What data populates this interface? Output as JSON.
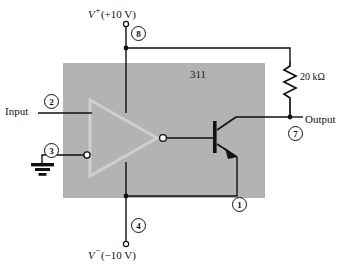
{
  "figure": {
    "chip_label": "311",
    "background_color": "#ffffff",
    "chip_body_color": "#b3b3b3",
    "line_color": "#111111"
  },
  "supplies": {
    "positive": {
      "label": "V",
      "sign": "+",
      "value": "(+10 V)",
      "pin": "8"
    },
    "negative": {
      "label": "V",
      "sign": "−",
      "value": "(−10 V)",
      "pin": "4"
    }
  },
  "terminals": [
    {
      "name": "input",
      "label": "Input",
      "pin": "2"
    },
    {
      "name": "ground",
      "label": "",
      "pin": "3"
    },
    {
      "name": "output",
      "label": "Output",
      "pin": "7"
    },
    {
      "name": "emitter",
      "label": "",
      "pin": "1"
    }
  ],
  "components": {
    "resistor": {
      "name": "pull-up-resistor",
      "value": "20 kΩ"
    },
    "transistor": {
      "name": "output-npn-transistor",
      "type": "NPN"
    },
    "ground_symbol": {
      "name": "ground-symbol"
    },
    "comparator": {
      "name": "comparator-triangle"
    }
  },
  "pins": {
    "p1": "1",
    "p2": "2",
    "p3": "3",
    "p4": "4",
    "p7": "7",
    "p8": "8"
  }
}
